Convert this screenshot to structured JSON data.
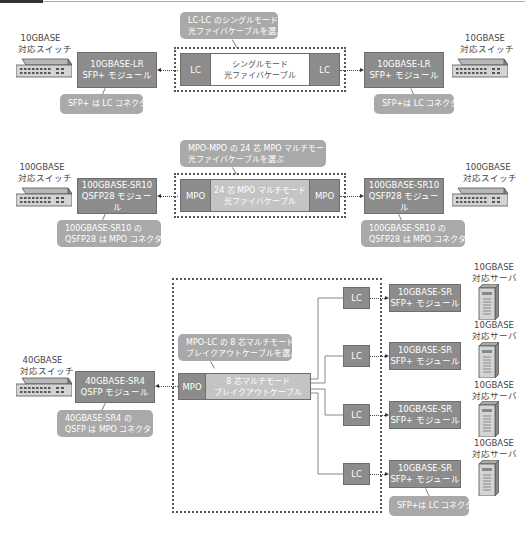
{
  "diagram": {
    "row1": {
      "left_switch": {
        "line1": "10GBASE",
        "line2": "対応スイッチ"
      },
      "left_module": {
        "line1": "10GBASE-LR",
        "line2": "SFP+ モジュール"
      },
      "left_note": "SFP+ は LC コネクタ",
      "cable_note": {
        "line1": "LC-LC のシングルモード",
        "line2": "光ファイバケーブルを選ぶ"
      },
      "cable": {
        "left_end": "LC",
        "right_end": "LC",
        "line1": "シングルモード",
        "line2": "光ファイバケーブル"
      },
      "right_module": {
        "line1": "10GBASE-LR",
        "line2": "SFP+ モジュール"
      },
      "right_note": "SFP+は LC コネクタ",
      "right_switch": {
        "line1": "10GBASE",
        "line2": "対応スイッチ"
      }
    },
    "row2": {
      "left_switch": {
        "line1": "100GBASE",
        "line2": "対応スイッチ"
      },
      "left_module": {
        "line1": "100GBASE-SR10",
        "line2": "QSFP28 モジュール"
      },
      "left_note": {
        "line1": "100GBASE-SR10 の",
        "line2": "QSFP28 は MPO コネクタ"
      },
      "cable_note": {
        "line1": "MPO-MPO の 24 芯 MPO マルチモード",
        "line2": "光ファイバケーブルを選ぶ"
      },
      "cable": {
        "left_end": "MPO",
        "right_end": "MPO",
        "line1": "24 芯 MPO マルチモード",
        "line2": "光ファイバケーブル"
      },
      "right_module": {
        "line1": "100GBASE-SR10",
        "line2": "QSFP28 モジュール"
      },
      "right_note": {
        "line1": "100GBASE-SR10 の",
        "line2": "QSFP28 は MPO コネクタ"
      },
      "right_switch": {
        "line1": "100GBASE",
        "line2": "対応スイッチ"
      }
    },
    "row3": {
      "left_switch": {
        "line1": "40GBASE",
        "line2": "対応スイッチ"
      },
      "left_module": {
        "line1": "40GBASE-SR4",
        "line2": "QSFP モジュール"
      },
      "left_note": {
        "line1": "40GBASE-SR4 の",
        "line2": "QSFP は MPO コネクタ"
      },
      "cable_note": {
        "line1": "MPO-LC の 8 芯マルチモード",
        "line2": "ブレイクアウトケーブルを選ぶ"
      },
      "cable": {
        "left_end": "MPO",
        "line1": "8 芯マルチモード",
        "line2": "ブレイクアウトケーブル"
      },
      "lc_ends": [
        "LC",
        "LC",
        "LC",
        "LC"
      ],
      "sr_modules": [
        {
          "line1": "10GBASE-SR",
          "line2": "SFP+ モジュール"
        },
        {
          "line1": "10GBASE-SR",
          "line2": "SFP+ モジュール"
        },
        {
          "line1": "10GBASE-SR",
          "line2": "SFP+ モジュール"
        },
        {
          "line1": "10GBASE-SR",
          "line2": "SFP+ モジュール"
        }
      ],
      "servers": [
        {
          "line1": "10GBASE",
          "line2": "対応サーバ"
        },
        {
          "line1": "10GBASE",
          "line2": "対応サーバ"
        },
        {
          "line1": "10GBASE",
          "line2": "対応サーバ"
        },
        {
          "line1": "10GBASE",
          "line2": "対応サーバ"
        }
      ],
      "bottom_note": "SFP+は LC コネクタ"
    }
  },
  "colors": {
    "module_fill": "#8c8c8c",
    "note_fill": "#a9a9a9",
    "multimode_cable_fill": "#c4c4c4",
    "singlemode_cable_fill": "#ffffff"
  }
}
